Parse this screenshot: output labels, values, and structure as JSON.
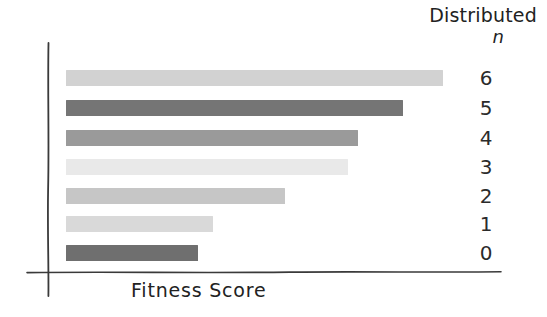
{
  "chart_data": {
    "type": "bar",
    "orientation": "horizontal",
    "title": "Distributed",
    "subtitle": "n",
    "xlabel": "Fitness Score",
    "ylabel": "",
    "categories": [
      "6",
      "5",
      "4",
      "3",
      "2",
      "1",
      "0"
    ],
    "values": [
      377,
      337,
      292,
      282,
      219,
      147,
      132
    ],
    "xlim": [
      0,
      434
    ],
    "ylim": [
      0,
      7
    ],
    "grid": false,
    "legend": null,
    "style": "hand-drawn",
    "bar_colors": [
      "#d2d2d2",
      "#757575",
      "#9a9a9a",
      "#e9e9e9",
      "#c6c6c6",
      "#d9d9d9",
      "#6f6f6f"
    ],
    "tick_labels_y": [
      "6",
      "5",
      "4",
      "3",
      "2",
      "1",
      "0"
    ],
    "tick_labels_x": []
  },
  "axis": {
    "line_color": "#3a3a3a"
  },
  "bars": [
    {
      "label": "6",
      "value": 377,
      "color": "#d2d2d2",
      "top": 70,
      "width": 377
    },
    {
      "label": "5",
      "value": 337,
      "color": "#757575",
      "top": 100,
      "width": 337
    },
    {
      "label": "4",
      "value": 292,
      "color": "#9a9a9a",
      "top": 130,
      "width": 292
    },
    {
      "label": "3",
      "value": 282,
      "color": "#e9e9e9",
      "top": 159,
      "width": 282
    },
    {
      "label": "2",
      "value": 219,
      "color": "#c6c6c6",
      "top": 188,
      "width": 219
    },
    {
      "label": "1",
      "value": 147,
      "color": "#d9d9d9",
      "top": 216,
      "width": 147
    },
    {
      "label": "0",
      "value": 132,
      "color": "#6f6f6f",
      "top": 245,
      "width": 132
    }
  ]
}
